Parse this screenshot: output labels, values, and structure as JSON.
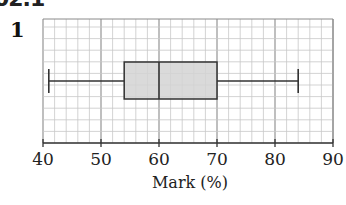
{
  "header": {
    "section": "02.1",
    "question_number": "1"
  },
  "colors": {
    "grid_minor": "#c8c8c8",
    "grid_major": "#8a8a8a",
    "box_fill": "#d4d4d4",
    "stroke": "#333333"
  },
  "chart_data": {
    "type": "boxplot",
    "title": "",
    "xlabel": "Mark (%)",
    "ylabel": "",
    "xlim": [
      40,
      90
    ],
    "ticks": [
      40,
      50,
      60,
      70,
      80,
      90
    ],
    "tick_labels": [
      "40",
      "50",
      "60",
      "70",
      "80",
      "90"
    ],
    "grid": true,
    "grid_minor_step": 2,
    "grid_major_step": 10,
    "box": {
      "min": 41,
      "q1": 54,
      "median": 60,
      "q3": 70,
      "max": 84
    }
  }
}
